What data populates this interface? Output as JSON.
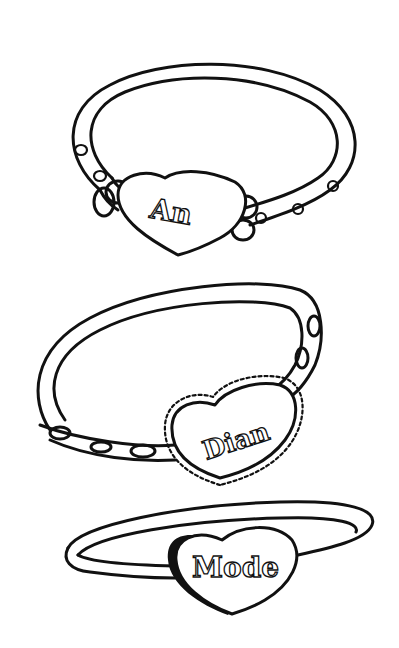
{
  "illustration": {
    "type": "line-art coloring page",
    "background": "#ffffff",
    "ink_color": "#111111",
    "bracelets": [
      {
        "label": "An",
        "style": "bangle with dots and side rings"
      },
      {
        "label": "Dian",
        "style": "bangle with scalloped heart and oval studs"
      },
      {
        "label": "Mode",
        "style": "thin ring band with plain heart"
      }
    ]
  }
}
